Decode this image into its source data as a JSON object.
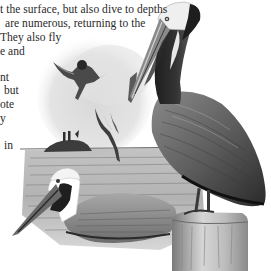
{
  "page": {
    "type": "book-page-excerpt",
    "text_lines": [
      "t the surface, but also dive to depths",
      "are numerous, returning to the",
      "They also fly",
      "e and",
      "",
      "nt",
      "but",
      "ote",
      "y",
      "",
      "in"
    ]
  },
  "illustration": {
    "subject": "brown pelicans",
    "elements": [
      "standing-pelican-on-post",
      "swimming-pelican",
      "diving-pelican-1",
      "diving-pelican-2",
      "diving-pelican-3",
      "small-island-with-birds",
      "sea-water",
      "wooden-post"
    ]
  },
  "colors": {
    "background": "#ffffff",
    "ink": "#2a2a2a",
    "water": "#9a9a9a",
    "sky_haze": "#dcdcdc"
  }
}
